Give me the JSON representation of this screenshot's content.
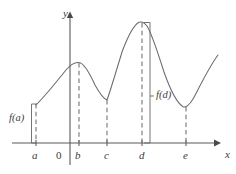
{
  "figure": {
    "background_color": "#ffffff",
    "curve_color": "#6a6a6a",
    "axis_color": "#5a5a5a",
    "dash_color": "#7a7a7a",
    "text_color": "#3d3d3d"
  },
  "axes": {
    "y_label": "y",
    "x_label": "x",
    "origin_label": "0",
    "x_axis_y_px": 143,
    "y_axis_x_px": 70,
    "x_axis_start_px": 12,
    "x_axis_end_px": 218,
    "y_axis_top_px": 14,
    "y_axis_bottom_px": 165
  },
  "x_ticks": [
    {
      "label": "a",
      "x_px": 36
    },
    {
      "label": "b",
      "x_px": 79
    },
    {
      "label": "c",
      "x_px": 107
    },
    {
      "label": "d",
      "x_px": 142
    },
    {
      "label": "e",
      "x_px": 186
    }
  ],
  "value_labels": [
    {
      "label": "f(a)",
      "x_px": 9,
      "y_px": 117
    },
    {
      "label": "f(d)",
      "x_px": 156,
      "y_px": 94
    }
  ],
  "chart_data": {
    "type": "line",
    "xlabel": "x",
    "ylabel": "y",
    "grid": false,
    "legend": null,
    "annotations": [
      "f(a)",
      "f(d)"
    ],
    "tick_labels_x": [
      "a",
      "0",
      "b",
      "c",
      "d",
      "e"
    ],
    "tick_labels_y": [],
    "key_points": [
      {
        "name": "a",
        "kind": "endpoint-left",
        "x_px": 36,
        "y_px": 105
      },
      {
        "name": "b",
        "kind": "local-maximum",
        "x_px": 79,
        "y_px": 63
      },
      {
        "name": "c",
        "kind": "cusp-local-minimum",
        "x_px": 107,
        "y_px": 100
      },
      {
        "name": "d",
        "kind": "absolute-maximum",
        "x_px": 142,
        "y_px": 22
      },
      {
        "name": "e",
        "kind": "local-minimum",
        "x_px": 186,
        "y_px": 107
      },
      {
        "name": "right-end",
        "kind": "endpoint-right",
        "x_px": 218,
        "y_px": 55
      }
    ],
    "curve_path": "M 36,105 C 45,96 58,80 66,70 C 71,64 75,62 79,62.5 C 84,63 90,74 95,85 C 100,94 104,99 107,100 C 110,92 116,72 122,52 C 128,36 134,25 139,22.3 C 141,21.6 144,22 147,26 C 152,34 158,53 164,72 C 170,89 177,103 183,106.7 C 185,107.6 189,106 193,99 C 199,88 209,67 218,55",
    "dashed_drops": [
      {
        "label": "b",
        "x_px": 79,
        "y_top_px": 63,
        "y_bottom_px": 143
      },
      {
        "label": "c",
        "x_px": 107,
        "y_top_px": 100,
        "y_bottom_px": 143
      },
      {
        "label": "d",
        "x_px": 142,
        "y_top_px": 22,
        "y_bottom_px": 143
      },
      {
        "label": "e",
        "x_px": 186,
        "y_top_px": 107,
        "y_bottom_px": 143
      },
      {
        "label": "a",
        "x_px": 36,
        "y_top_px": 105,
        "y_bottom_px": 143
      }
    ],
    "braces": [
      {
        "label": "f(a)",
        "x_px": 33,
        "y_top_px": 104,
        "y_bottom_px": 143
      },
      {
        "label": "f(d)",
        "x_px": 150,
        "y_top_px": 22,
        "y_bottom_px": 143
      }
    ]
  }
}
